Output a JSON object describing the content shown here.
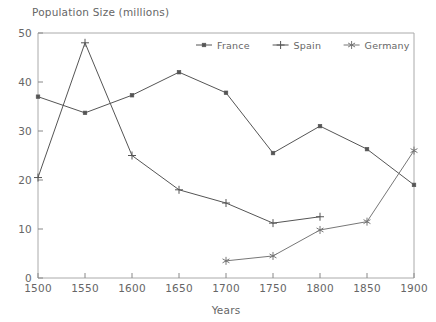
{
  "chart_data": {
    "type": "line",
    "title": "Population Size (millions)",
    "xlabel": "Years",
    "ylabel": "",
    "x": [
      1500,
      1550,
      1600,
      1650,
      1700,
      1750,
      1800,
      1850,
      1900
    ],
    "xticks": [
      "1500",
      "1550",
      "1600",
      "1650",
      "1700",
      "1750",
      "1800",
      "1850",
      "1900"
    ],
    "yticks": [
      "0",
      "10",
      "20",
      "30",
      "40",
      "50"
    ],
    "xlim": [
      1500,
      1900
    ],
    "ylim": [
      0,
      50
    ],
    "grid": false,
    "legend_position": "top-center",
    "series": [
      {
        "name": "France",
        "marker": "square",
        "color": "#555555",
        "x": [
          1500,
          1550,
          1600,
          1650,
          1700,
          1750,
          1800,
          1850,
          1900
        ],
        "values": [
          37.0,
          33.7,
          37.3,
          42.0,
          37.8,
          25.5,
          31.0,
          26.3,
          19.0
        ]
      },
      {
        "name": "Spain",
        "marker": "plus",
        "color": "#555555",
        "x": [
          1500,
          1550,
          1600,
          1650,
          1700,
          1750,
          1800
        ],
        "values": [
          20.5,
          48.0,
          25.0,
          18.0,
          15.3,
          11.2,
          12.5
        ]
      },
      {
        "name": "Germany",
        "marker": "asterisk",
        "color": "#777777",
        "x": [
          1700,
          1750,
          1800,
          1850,
          1900
        ],
        "values": [
          3.5,
          4.5,
          9.8,
          11.5,
          26.0
        ]
      }
    ]
  },
  "legend": {
    "items": [
      {
        "label": "France",
        "marker": "square"
      },
      {
        "label": "Spain",
        "marker": "plus"
      },
      {
        "label": "Germany",
        "marker": "asterisk"
      }
    ]
  },
  "colors": {
    "france": "#555555",
    "spain": "#555555",
    "germany": "#777777",
    "frame": "#aaaaaa",
    "text": "#666666"
  }
}
